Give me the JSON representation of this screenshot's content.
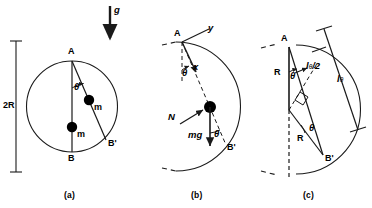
{
  "figure": {
    "stroke_color": "#1a1a1a",
    "mass_color": "#000000",
    "background": "#ffffff"
  },
  "panels": [
    {
      "id": "a",
      "caption": "(a)",
      "labels": {
        "apex": "A",
        "bottom": "B",
        "chord_end": "B'",
        "mass_1": "m",
        "mass_2": "m",
        "angle": "θ",
        "diameter": "2R",
        "gravity": "g"
      }
    },
    {
      "id": "b",
      "caption": "(b)",
      "labels": {
        "apex": "A",
        "chord_end": "B'",
        "axis_x": "x",
        "axis_y": "y",
        "normal_force": "N",
        "weight": "mg",
        "angle_top": "θ",
        "angle_bottom": "θ"
      }
    },
    {
      "id": "c",
      "caption": "(c)",
      "labels": {
        "apex": "A",
        "chord_end": "B'",
        "radius_1": "R",
        "radius_2": "R",
        "half_chord": "l",
        "half_chord_sub": "θ",
        "half_chord_div": "/2",
        "chord": "l",
        "chord_sub": "θ",
        "angle_top": "θ",
        "angle_bottom": "θ"
      }
    }
  ]
}
